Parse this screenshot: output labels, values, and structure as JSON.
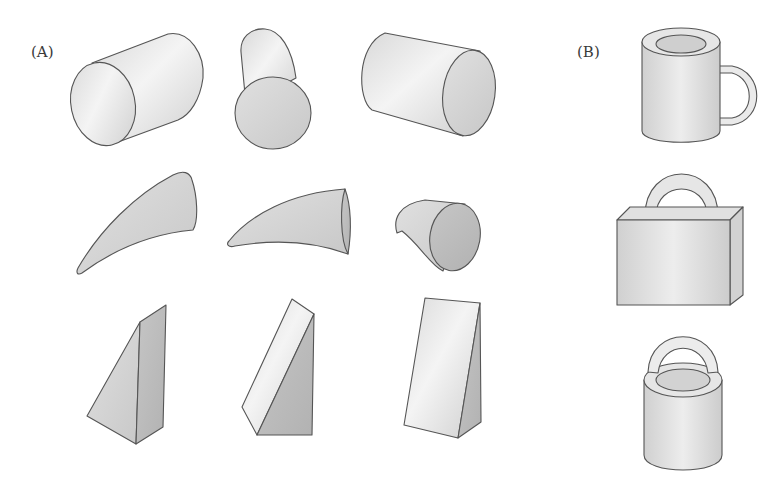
{
  "figure": {
    "panel_a": {
      "label": "(A)",
      "rows": [
        {
          "shape": "cylinder",
          "items": [
            "cylinder-left-face",
            "cylinder-front-face",
            "cylinder-right-face"
          ]
        },
        {
          "shape": "curved-cone",
          "items": [
            "horn-tilted-up",
            "horn-horizontal",
            "horn-short-curled"
          ]
        },
        {
          "shape": "wedge",
          "items": [
            "wedge-left-view",
            "wedge-center-view",
            "wedge-right-view"
          ]
        }
      ]
    },
    "panel_b": {
      "label": "(B)",
      "objects": [
        "mug",
        "briefcase",
        "bucket"
      ]
    },
    "colors": {
      "background": "#ffffff",
      "outline": "#555555",
      "light_face": "#ededed",
      "mid_face": "#d6d6d6",
      "dark_face": "#bdbdbd"
    }
  }
}
